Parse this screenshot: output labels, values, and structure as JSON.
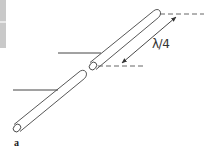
{
  "figure": {
    "panel_label": "a",
    "dimension_label": "λ/4",
    "colors": {
      "stroke": "#444444",
      "dashed": "#555555",
      "edge_bar": "#c9c9c9"
    }
  }
}
